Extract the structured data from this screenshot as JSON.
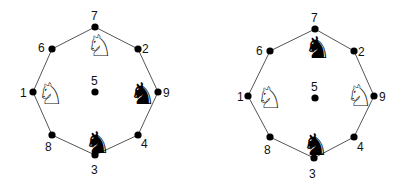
{
  "diagrams": [
    {
      "name": "left-position",
      "nodes": [
        {
          "id": "7",
          "x": 95,
          "y": 27,
          "lx": 91,
          "ly": 20
        },
        {
          "id": "2",
          "x": 138,
          "y": 49,
          "lx": 142,
          "ly": 53
        },
        {
          "id": "9",
          "x": 158,
          "y": 92,
          "lx": 163,
          "ly": 97
        },
        {
          "id": "4",
          "x": 138,
          "y": 135,
          "lx": 141,
          "ly": 148
        },
        {
          "id": "3",
          "x": 95,
          "y": 155,
          "lx": 91,
          "ly": 174
        },
        {
          "id": "8",
          "x": 52,
          "y": 135,
          "lx": 45,
          "ly": 151
        },
        {
          "id": "1",
          "x": 33,
          "y": 92,
          "lx": 20,
          "ly": 97
        },
        {
          "id": "6",
          "x": 52,
          "y": 49,
          "lx": 38,
          "ly": 52
        },
        {
          "id": "5",
          "x": 95,
          "y": 92,
          "lx": 91,
          "ly": 85
        }
      ],
      "knights": [
        {
          "color": "white",
          "glyph": "♘",
          "x": 86,
          "y": 56
        },
        {
          "color": "white",
          "glyph": "♘",
          "x": 37,
          "y": 104
        },
        {
          "color": "black",
          "glyph": "♞",
          "x": 129,
          "y": 104
        },
        {
          "color": "black",
          "glyph": "♞",
          "x": 84,
          "y": 153
        }
      ]
    },
    {
      "name": "right-position",
      "nodes": [
        {
          "id": "7",
          "x": 315,
          "y": 29,
          "lx": 311,
          "ly": 22
        },
        {
          "id": "2",
          "x": 354,
          "y": 51,
          "lx": 358,
          "ly": 56
        },
        {
          "id": "9",
          "x": 374,
          "y": 96,
          "lx": 379,
          "ly": 101
        },
        {
          "id": "4",
          "x": 354,
          "y": 137,
          "lx": 357,
          "ly": 151
        },
        {
          "id": "3",
          "x": 314,
          "y": 158,
          "lx": 309,
          "ly": 178
        },
        {
          "id": "8",
          "x": 270,
          "y": 137,
          "lx": 264,
          "ly": 154
        },
        {
          "id": "1",
          "x": 248,
          "y": 96,
          "lx": 237,
          "ly": 101
        },
        {
          "id": "6",
          "x": 270,
          "y": 51,
          "lx": 256,
          "ly": 55
        },
        {
          "id": "5",
          "x": 315,
          "y": 98,
          "lx": 311,
          "ly": 91
        }
      ],
      "knights": [
        {
          "color": "black",
          "glyph": "♞",
          "x": 304,
          "y": 58
        },
        {
          "color": "white",
          "glyph": "♘",
          "x": 256,
          "y": 108
        },
        {
          "color": "white",
          "glyph": "♘",
          "x": 346,
          "y": 106
        },
        {
          "color": "black",
          "glyph": "♞",
          "x": 302,
          "y": 155
        }
      ]
    }
  ],
  "colors": {
    "line": "#555555",
    "dot": "#000000",
    "background": "#ffffff"
  }
}
